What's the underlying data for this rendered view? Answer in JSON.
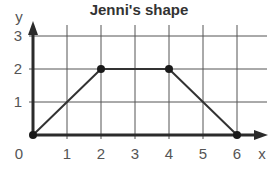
{
  "chart_data": {
    "type": "line",
    "title": "Jenni's shape",
    "xlabel": "x",
    "ylabel": "y",
    "xlim": [
      0,
      6
    ],
    "ylim": [
      0,
      3
    ],
    "grid": true,
    "x_ticks": [
      "0",
      "1",
      "2",
      "3",
      "4",
      "5",
      "6"
    ],
    "y_ticks": [
      "1",
      "2",
      "3"
    ],
    "origin_label": "0",
    "series": [
      {
        "name": "Jenni's shape (trapezium)",
        "closed": true,
        "points": [
          {
            "x": 0,
            "y": 0
          },
          {
            "x": 2,
            "y": 2
          },
          {
            "x": 4,
            "y": 2
          },
          {
            "x": 6,
            "y": 0
          }
        ]
      }
    ],
    "colors": {
      "axis": "#2b2b2b",
      "grid": "#555555",
      "shape": "#333333",
      "text": "#555555"
    }
  }
}
